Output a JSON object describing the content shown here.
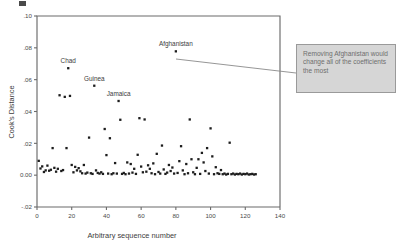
{
  "chart_data": {
    "type": "scatter",
    "title": "",
    "xlabel": "Arbitrary sequence number",
    "ylabel": "Cook's Distance",
    "xlim": [
      0,
      140
    ],
    "ylim": [
      -0.02,
      0.1
    ],
    "xticks": [
      "0",
      "20",
      "40",
      "60",
      "80",
      "100",
      "120",
      "140"
    ],
    "xtick_values": [
      0,
      20,
      40,
      60,
      80,
      100,
      120,
      140
    ],
    "yticks": [
      ".10",
      ".08",
      ".06",
      ".04",
      ".02",
      "0.00",
      "-.02"
    ],
    "ytick_values": [
      0.1,
      0.08,
      0.06,
      0.04,
      0.02,
      0.0,
      -0.02
    ],
    "grid": false,
    "legend": "none",
    "marker": "square",
    "marker_color": "#1d1d1d",
    "series": [
      {
        "name": "Cook's Distance",
        "points": [
          [
            1,
            0.009
          ],
          [
            2,
            0.0042
          ],
          [
            3,
            0.0055
          ],
          [
            4,
            0.002
          ],
          [
            5,
            0.003
          ],
          [
            6,
            0.006
          ],
          [
            7,
            0.0028
          ],
          [
            8,
            0.0034
          ],
          [
            9,
            0.017
          ],
          [
            10,
            0.0046
          ],
          [
            11,
            0.0022
          ],
          [
            12,
            0.004
          ],
          [
            13,
            0.0502
          ],
          [
            14,
            0.0026
          ],
          [
            15,
            0.0032
          ],
          [
            16,
            0.0492
          ],
          [
            17,
            0.017
          ],
          [
            18,
            0.0672
          ],
          [
            19,
            0.0498
          ],
          [
            20,
            0.0064
          ],
          [
            21,
            0.0018
          ],
          [
            22,
            0.0052
          ],
          [
            23,
            0.003
          ],
          [
            24,
            0.0044
          ],
          [
            25,
            0.0024
          ],
          [
            26,
            0.0012
          ],
          [
            27,
            0.0064
          ],
          [
            28,
            0.001
          ],
          [
            29,
            0.0016
          ],
          [
            30,
            0.0236
          ],
          [
            31,
            0.0012
          ],
          [
            32,
            0.0008
          ],
          [
            33,
            0.0562
          ],
          [
            34,
            0.003
          ],
          [
            35,
            0.0014
          ],
          [
            36,
            0.001
          ],
          [
            37,
            0.0018
          ],
          [
            38,
            0.0008
          ],
          [
            39,
            0.029
          ],
          [
            40,
            0.0126
          ],
          [
            41,
            0.001
          ],
          [
            42,
            0.0232
          ],
          [
            43,
            0.0006
          ],
          [
            44,
            0.0012
          ],
          [
            45,
            0.0076
          ],
          [
            46,
            0.001
          ],
          [
            47,
            0.0466
          ],
          [
            48,
            0.0348
          ],
          [
            49,
            0.0008
          ],
          [
            50,
            0.0014
          ],
          [
            51,
            0.0006
          ],
          [
            52,
            0.008
          ],
          [
            53,
            0.001
          ],
          [
            54,
            0.007
          ],
          [
            55,
            0.0016
          ],
          [
            56,
            0.004
          ],
          [
            57,
            0.0008
          ],
          [
            58,
            0.0128
          ],
          [
            59,
            0.0358
          ],
          [
            60,
            0.0054
          ],
          [
            61,
            0.0018
          ],
          [
            62,
            0.035
          ],
          [
            63,
            0.0022
          ],
          [
            64,
            0.0062
          ],
          [
            65,
            0.004
          ],
          [
            66,
            0.0012
          ],
          [
            67,
            0.0074
          ],
          [
            68,
            0.0006
          ],
          [
            69,
            0.0134
          ],
          [
            70,
            0.002
          ],
          [
            71,
            0.001
          ],
          [
            72,
            0.0186
          ],
          [
            73,
            0.0036
          ],
          [
            74,
            0.0008
          ],
          [
            75,
            0.0016
          ],
          [
            76,
            0.0064
          ],
          [
            77,
            0.0026
          ],
          [
            78,
            0.0048
          ],
          [
            79,
            0.001
          ],
          [
            80,
            0.0778
          ],
          [
            81,
            0.0014
          ],
          [
            82,
            0.0088
          ],
          [
            83,
            0.0182
          ],
          [
            84,
            0.003
          ],
          [
            85,
            0.0006
          ],
          [
            86,
            0.007
          ],
          [
            87,
            0.0012
          ],
          [
            88,
            0.035
          ],
          [
            89,
            0.01
          ],
          [
            90,
            0.0018
          ],
          [
            91,
            0.0006
          ],
          [
            92,
            0.0046
          ],
          [
            93,
            0.01
          ],
          [
            94,
            0.0008
          ],
          [
            95,
            0.014
          ],
          [
            96,
            0.008
          ],
          [
            97,
            0.0026
          ],
          [
            98,
            0.017
          ],
          [
            99,
            0.001
          ],
          [
            100,
            0.0294
          ],
          [
            101,
            0.0118
          ],
          [
            102,
            0.0006
          ],
          [
            103,
            0.005
          ],
          [
            104,
            0.0012
          ],
          [
            105,
            0.0008
          ],
          [
            106,
            0.0032
          ],
          [
            107,
            0.0006
          ],
          [
            108,
            0.001
          ],
          [
            109,
            0.0004
          ],
          [
            110,
            0.0008
          ],
          [
            111,
            0.0204
          ],
          [
            112,
            0.0006
          ],
          [
            113,
            0.001
          ],
          [
            114,
            0.0004
          ],
          [
            115,
            0.0008
          ],
          [
            116,
            0.0006
          ],
          [
            117,
            0.001
          ],
          [
            118,
            0.0004
          ],
          [
            119,
            0.0008
          ],
          [
            120,
            0.0006
          ],
          [
            121,
            0.001
          ],
          [
            122,
            0.0004
          ],
          [
            123,
            0.0006
          ],
          [
            124,
            0.0008
          ],
          [
            125,
            0.0004
          ],
          [
            126,
            0.0006
          ]
        ]
      }
    ],
    "annotations": [
      {
        "label": "Chad",
        "x": 18,
        "y": 0.0672,
        "label_dx": 0,
        "label_dy": -0.006
      },
      {
        "label": "Guinea",
        "x": 33,
        "y": 0.0562,
        "label_dx": 0,
        "label_dy": -0.006
      },
      {
        "label": "Jamaica",
        "x": 47,
        "y": 0.0466,
        "label_dx": 0,
        "label_dy": -0.006
      },
      {
        "label": "Afghanistan",
        "x": 80,
        "y": 0.0778,
        "label_dx": 0,
        "label_dy": -0.006
      }
    ]
  },
  "callout": {
    "text": "Removing Afghanistan would change all of the coefficients the most",
    "background": "#d6d6d6",
    "border_color": "#9a9a9a",
    "text_color": "#6e6e6e"
  }
}
